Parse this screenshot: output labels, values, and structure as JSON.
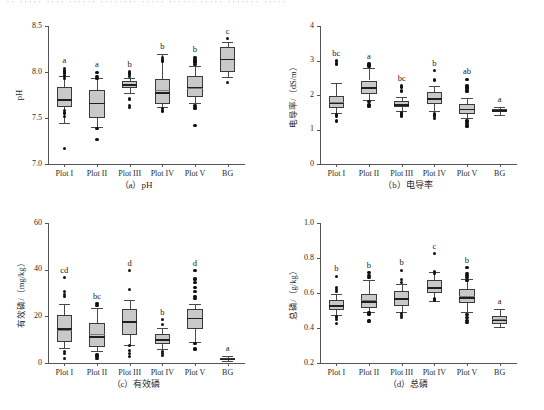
{
  "figure": {
    "top_cut_text": "·· ····· ···· ······ ········ ····· ······ ····· ······· ·····"
  },
  "chart_data": [
    {
      "type": "box",
      "panel": "a",
      "caption": "（a）pH",
      "title": "",
      "xlabel": "",
      "ylabel": "pH",
      "categories": [
        "Plot I",
        "Plot II",
        "Plot III",
        "Plot IV",
        "Plot V",
        "BG"
      ],
      "ylim": [
        7.0,
        8.5
      ],
      "yticks": [
        7.0,
        7.5,
        8.0,
        8.5
      ],
      "ytick_labels": [
        "7.0",
        "7.5",
        "8.0",
        "8.5"
      ],
      "grid": false,
      "legend": "none",
      "significance_letters": [
        "a",
        "a",
        "b",
        "b",
        "b",
        "c"
      ],
      "boxes": [
        {
          "category": "Plot I",
          "whisker_low": 7.45,
          "q1": 7.615,
          "median": 7.705,
          "mean": 7.695,
          "q3": 7.835,
          "whisker_high": 7.955,
          "outliers": [
            7.17,
            7.52,
            7.555,
            7.585,
            7.925,
            7.95,
            7.965,
            7.99,
            8.0,
            8.02,
            8.04
          ]
        },
        {
          "category": "Plot II",
          "whisker_low": 7.4,
          "q1": 7.5,
          "median": 7.665,
          "mean": 7.66,
          "q3": 7.8,
          "whisker_high": 7.94,
          "outliers": [
            7.265,
            7.385,
            7.93,
            7.955,
            7.995
          ]
        },
        {
          "category": "Plot III",
          "whisker_low": 7.77,
          "q1": 7.825,
          "median": 7.865,
          "mean": 7.855,
          "q3": 7.9,
          "whisker_high": 7.94,
          "outliers": [
            7.615,
            7.635,
            7.7,
            7.715,
            7.955,
            7.975,
            7.99,
            8.005
          ]
        },
        {
          "category": "Plot IV",
          "whisker_low": 7.62,
          "q1": 7.655,
          "median": 7.78,
          "mean": 7.805,
          "q3": 7.925,
          "whisker_high": 8.2,
          "outliers": [
            7.57,
            7.585,
            7.605,
            8.11,
            8.125,
            8.14,
            8.155
          ]
        },
        {
          "category": "Plot V",
          "whisker_low": 7.66,
          "q1": 7.725,
          "median": 7.84,
          "mean": 7.83,
          "q3": 7.955,
          "whisker_high": 8.06,
          "outliers": [
            7.42,
            7.6,
            7.615,
            7.635,
            8.08,
            8.1,
            8.12,
            8.14,
            8.16
          ]
        },
        {
          "category": "BG",
          "whisker_low": 7.95,
          "q1": 8.005,
          "median": 8.145,
          "mean": 8.14,
          "q3": 8.275,
          "whisker_high": 8.33,
          "outliers": [
            7.885,
            8.36
          ]
        }
      ]
    },
    {
      "type": "box",
      "panel": "b",
      "caption": "（b）电导率",
      "title": "",
      "xlabel": "",
      "ylabel": "电导率/（dS/m）",
      "categories": [
        "Plot I",
        "Plot II",
        "Plot III",
        "Plot IV",
        "Plot V",
        "BG"
      ],
      "ylim": [
        0,
        4
      ],
      "yticks": [
        0,
        1,
        2,
        3,
        4
      ],
      "ytick_labels": [
        "0",
        "1",
        "2",
        "3",
        "4"
      ],
      "grid": false,
      "legend": "none",
      "significance_letters": [
        "bc",
        "a",
        "bc",
        "b",
        "ab",
        "a"
      ],
      "boxes": [
        {
          "category": "Plot I",
          "whisker_low": 1.49,
          "q1": 1.62,
          "median": 1.78,
          "mean": 1.79,
          "q3": 1.97,
          "whisker_high": 2.34,
          "outliers": [
            1.24,
            1.27,
            1.37,
            1.4,
            1.43,
            2.88,
            2.92,
            2.96,
            3.0
          ]
        },
        {
          "category": "Plot II",
          "whisker_low": 1.86,
          "q1": 2.02,
          "median": 2.22,
          "mean": 2.23,
          "q3": 2.42,
          "whisker_high": 2.78,
          "outliers": [
            1.68,
            1.73,
            1.8,
            2.82,
            2.86,
            2.9
          ]
        },
        {
          "category": "Plot III",
          "whisker_low": 1.53,
          "q1": 1.65,
          "median": 1.74,
          "mean": 1.75,
          "q3": 1.83,
          "whisker_high": 1.95,
          "outliers": [
            1.38,
            1.42,
            1.45,
            1.48,
            2.1,
            2.14,
            2.22,
            2.26
          ]
        },
        {
          "category": "Plot IV",
          "whisker_low": 1.55,
          "q1": 1.74,
          "median": 1.9,
          "mean": 1.91,
          "q3": 2.08,
          "whisker_high": 2.25,
          "outliers": [
            1.33,
            1.37,
            1.42,
            1.46,
            2.42,
            2.46,
            2.7
          ]
        },
        {
          "category": "Plot V",
          "whisker_low": 1.33,
          "q1": 1.46,
          "median": 1.6,
          "mean": 1.6,
          "q3": 1.73,
          "whisker_high": 1.92,
          "outliers": [
            1.08,
            1.12,
            1.17,
            1.22,
            1.27,
            2.1,
            2.14,
            2.18,
            2.22,
            2.26,
            2.46
          ]
        },
        {
          "category": "BG",
          "whisker_low": 1.43,
          "q1": 1.53,
          "median": 1.56,
          "mean": 1.56,
          "q3": 1.6,
          "whisker_high": 1.64,
          "outliers": []
        }
      ]
    },
    {
      "type": "box",
      "panel": "c",
      "caption": "（c）有效磷",
      "title": "",
      "xlabel": "",
      "ylabel": "有效磷/（mg/kg）",
      "categories": [
        "Plot I",
        "Plot II",
        "Plot III",
        "Plot IV",
        "Plot V",
        "BG"
      ],
      "ylim": [
        0,
        60
      ],
      "yticks": [
        0,
        20,
        40,
        60
      ],
      "ytick_labels": [
        "0",
        "20",
        "40",
        "60"
      ],
      "grid": false,
      "legend": "none",
      "significance_letters": [
        "cd",
        "bc",
        "d",
        "b",
        "d",
        "a"
      ],
      "boxes": [
        {
          "category": "Plot I",
          "whisker_low": 6.5,
          "q1": 9.0,
          "median": 14.8,
          "mean": 14.3,
          "q3": 20.5,
          "whisker_high": 25.5,
          "outliers": [
            2.0,
            4.0,
            5.0,
            28.5,
            29.5,
            30.5,
            36.5
          ]
        },
        {
          "category": "Plot II",
          "whisker_low": 5.0,
          "q1": 7.0,
          "median": 11.5,
          "mean": 12.3,
          "q3": 17.2,
          "whisker_high": 23.5,
          "outliers": [
            1.8,
            3.0,
            3.8,
            24.5,
            25.5
          ]
        },
        {
          "category": "Plot III",
          "whisker_low": 7.8,
          "q1": 11.8,
          "median": 17.8,
          "mean": 18.2,
          "q3": 23.2,
          "whisker_high": 27.0,
          "outliers": [
            2.8,
            4.0,
            5.2,
            7.5,
            31.5,
            39.5
          ]
        },
        {
          "category": "Plot IV",
          "whisker_low": 6.0,
          "q1": 8.3,
          "median": 10.3,
          "mean": 10.5,
          "q3": 12.5,
          "whisker_high": 14.8,
          "outliers": [
            3.2,
            4.0,
            4.8,
            16.5,
            18.5
          ]
        },
        {
          "category": "Plot V",
          "whisker_low": 9.0,
          "q1": 14.5,
          "median": 19.5,
          "mean": 19.3,
          "q3": 23.0,
          "whisker_high": 25.5,
          "outliers": [
            6.0,
            8.5,
            27.5,
            28.5,
            30.5,
            32.5,
            34.5,
            36.0,
            39.5
          ]
        },
        {
          "category": "BG",
          "whisker_low": 0.8,
          "q1": 1.3,
          "median": 1.8,
          "mean": 1.8,
          "q3": 2.3,
          "whisker_high": 3.0,
          "outliers": []
        }
      ]
    },
    {
      "type": "box",
      "panel": "d",
      "caption": "（d）总磷",
      "title": "",
      "xlabel": "",
      "ylabel": "总磷/（g/kg）",
      "categories": [
        "Plot I",
        "Plot II",
        "Plot III",
        "Plot IV",
        "Plot V",
        "BG"
      ],
      "ylim": [
        0.2,
        1.0
      ],
      "yticks": [
        0.2,
        0.4,
        0.6,
        0.8,
        1.0
      ],
      "ytick_labels": [
        "0.2",
        "0.4",
        "0.6",
        "0.8",
        "1.0"
      ],
      "grid": false,
      "legend": "none",
      "significance_letters": [
        "b",
        "b",
        "b",
        "c",
        "b",
        "a"
      ],
      "boxes": [
        {
          "category": "Plot I",
          "whisker_low": 0.475,
          "q1": 0.505,
          "median": 0.53,
          "mean": 0.533,
          "q3": 0.562,
          "whisker_high": 0.595,
          "outliers": [
            0.428,
            0.448,
            0.458,
            0.468,
            0.61,
            0.62,
            0.632,
            0.695
          ]
        },
        {
          "category": "Plot II",
          "whisker_low": 0.492,
          "q1": 0.515,
          "median": 0.552,
          "mean": 0.558,
          "q3": 0.595,
          "whisker_high": 0.672,
          "outliers": [
            0.44,
            0.48,
            0.49,
            0.69,
            0.7,
            0.715
          ]
        },
        {
          "category": "Plot III",
          "whisker_low": 0.492,
          "q1": 0.527,
          "median": 0.57,
          "mean": 0.573,
          "q3": 0.612,
          "whisker_high": 0.65,
          "outliers": [
            0.46,
            0.472,
            0.485,
            0.662,
            0.675,
            0.73
          ]
        },
        {
          "category": "Plot IV",
          "whisker_low": 0.552,
          "q1": 0.598,
          "median": 0.632,
          "mean": 0.63,
          "q3": 0.672,
          "whisker_high": 0.72,
          "outliers": [
            0.56,
            0.57,
            0.71,
            0.725,
            0.825
          ]
        },
        {
          "category": "Plot V",
          "whisker_low": 0.49,
          "q1": 0.545,
          "median": 0.575,
          "mean": 0.582,
          "q3": 0.622,
          "whisker_high": 0.678,
          "outliers": [
            0.43,
            0.445,
            0.462,
            0.478,
            0.672,
            0.688,
            0.7,
            0.712,
            0.745
          ]
        },
        {
          "category": "BG",
          "whisker_low": 0.405,
          "q1": 0.425,
          "median": 0.448,
          "mean": 0.45,
          "q3": 0.47,
          "whisker_high": 0.51,
          "outliers": []
        }
      ]
    }
  ]
}
